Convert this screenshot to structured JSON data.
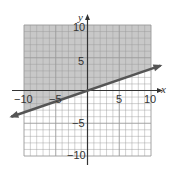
{
  "chart_data": {
    "type": "line",
    "title": "",
    "xlabel": "x",
    "ylabel": "y",
    "xlim": [
      -10,
      10
    ],
    "ylim": [
      -10,
      10
    ],
    "grid": true,
    "x_ticks": [
      -10,
      -5,
      5,
      10
    ],
    "y_ticks": [
      10,
      5,
      -5,
      -10
    ],
    "x_tick_labels": [
      "−10",
      "−5",
      "5",
      "10"
    ],
    "y_tick_labels": [
      "10",
      "5",
      "−5",
      "−10"
    ],
    "series": [
      {
        "name": "boundary line",
        "equation": "y = x/3",
        "style": "solid",
        "x": [
          -12,
          0,
          11.5
        ],
        "y": [
          -4,
          0,
          3.8
        ]
      }
    ],
    "shaded_region": "above line",
    "inequality": "y ≥ (1/3)x",
    "colors": {
      "shade": "#c8c8c8",
      "grid": "#9a9a9a",
      "line": "#555555",
      "axis": "#333333"
    }
  },
  "labels": {
    "x_axis": "x",
    "y_axis": "y",
    "xt_m10": "−10",
    "xt_m5": "−5",
    "xt_5": "5",
    "xt_10": "10",
    "yt_10": "10",
    "yt_5": "5",
    "yt_m5": "−5",
    "yt_m10": "−10"
  }
}
